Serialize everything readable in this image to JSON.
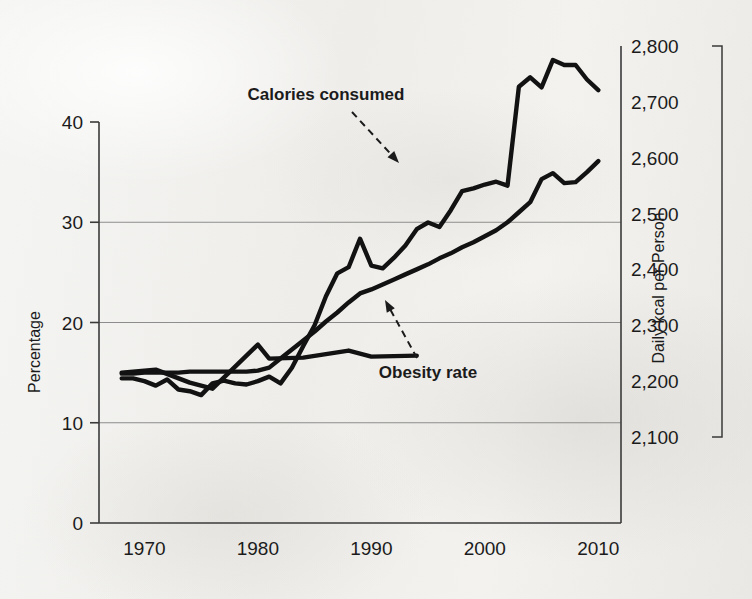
{
  "chart_data": {
    "type": "line",
    "title": "",
    "subtitle": "",
    "xlabel": "",
    "ylabel": "Percentage",
    "y2label": "Daily kcal per Person",
    "grid": true,
    "legend_position": "inline-annotations",
    "xlim": [
      1966,
      2012
    ],
    "ylim": [
      0,
      40
    ],
    "y2lim": [
      2100,
      2800
    ],
    "x_ticks": [
      "1970",
      "1980",
      "1990",
      "2000",
      "2010"
    ],
    "x_tick_values": [
      1970,
      1980,
      1990,
      2000,
      2010
    ],
    "y_ticks": [
      "0",
      "10",
      "20",
      "30",
      "40"
    ],
    "y_tick_values": [
      0,
      10,
      20,
      30,
      40
    ],
    "y2_ticks": [
      "2,100",
      "2,200",
      "2,300",
      "2,400",
      "2,500",
      "2,600",
      "2,700",
      "2,800"
    ],
    "y2_tick_values": [
      2100,
      2200,
      2300,
      2400,
      2500,
      2600,
      2700,
      2800
    ],
    "gridlines_y": [
      10,
      20,
      30
    ],
    "annotations": [
      {
        "name": "calories-consumed",
        "text": "Calories consumed",
        "label_x": 326,
        "label_y": 100,
        "leader_from_x": 352,
        "leader_from_y": 112,
        "leader_to_x": 399,
        "leader_to_y": 163
      },
      {
        "name": "obesity-rate",
        "text": "Obesity rate",
        "label_x": 428,
        "label_y": 378,
        "leader_from_x": 417,
        "leader_from_y": 358,
        "leader_to_x": 385,
        "leader_to_y": 300
      }
    ],
    "series": [
      {
        "name": "Calories consumed",
        "axis": "right",
        "unit": "kcal/day",
        "x": [
          1968,
          1969,
          1970,
          1971,
          1972,
          1973,
          1974,
          1975,
          1976,
          1977,
          1978,
          1979,
          1980,
          1981,
          1982,
          1983,
          1984,
          1985,
          1986,
          1987,
          1988,
          1989,
          1990,
          1991,
          1992,
          1993,
          1994,
          1995,
          1996,
          1997,
          1998,
          1999,
          2000,
          2001,
          2002,
          2003,
          2004,
          2005,
          2006,
          2007,
          2008,
          2009,
          2010
        ],
        "values": [
          2205,
          2205,
          2200,
          2192,
          2203,
          2185,
          2182,
          2175,
          2196,
          2201,
          2196,
          2194,
          2200,
          2208,
          2196,
          2224,
          2263,
          2300,
          2352,
          2393,
          2404,
          2455,
          2407,
          2402,
          2421,
          2443,
          2472,
          2484,
          2476,
          2506,
          2540,
          2545,
          2552,
          2557,
          2550,
          2727,
          2744,
          2726,
          2775,
          2766,
          2766,
          2740,
          2721
        ]
      },
      {
        "name": "Obesity rate",
        "axis": "left",
        "unit": "percent",
        "x": [
          1968,
          1969,
          1970,
          1971,
          1972,
          1973,
          1974,
          1975,
          1976,
          1977,
          1978,
          1979,
          1980,
          1981,
          1982,
          1983,
          1984,
          1985,
          1986,
          1987,
          1988,
          1989,
          1990,
          1991,
          1992,
          1993,
          1994,
          1995,
          1996,
          1997,
          1998,
          1999,
          2000,
          2001,
          2002,
          2003,
          2004,
          2005,
          2006,
          2007,
          2008,
          2009,
          2010
        ],
        "values": [
          14.9,
          14.9,
          15.0,
          15.0,
          15.0,
          15.0,
          15.1,
          15.1,
          15.1,
          15.1,
          15.1,
          15.1,
          15.2,
          15.5,
          16.4,
          17.3,
          18.2,
          19.1,
          20.1,
          21.0,
          22.0,
          22.9,
          23.3,
          23.8,
          24.3,
          24.8,
          25.3,
          25.8,
          26.4,
          26.9,
          27.5,
          28.0,
          28.6,
          29.2,
          30.0,
          31.0,
          32.0,
          34.3,
          34.9,
          33.9,
          34.0,
          35.0,
          36.1
        ]
      },
      {
        "name": "Obesity rate (survey points)",
        "axis": "left",
        "note": "overlapping jagged early-period survey trace",
        "x": [
          1968,
          1971,
          1974,
          1976,
          1980,
          1981,
          1984,
          1988,
          1990,
          1994
        ],
        "values": [
          15.0,
          15.3,
          14.0,
          13.4,
          17.8,
          16.4,
          16.5,
          17.2,
          16.6,
          16.7
        ]
      }
    ]
  },
  "axes": {
    "left": {
      "title": "Percentage"
    },
    "right": {
      "title": "Daily kcal per Person"
    }
  }
}
